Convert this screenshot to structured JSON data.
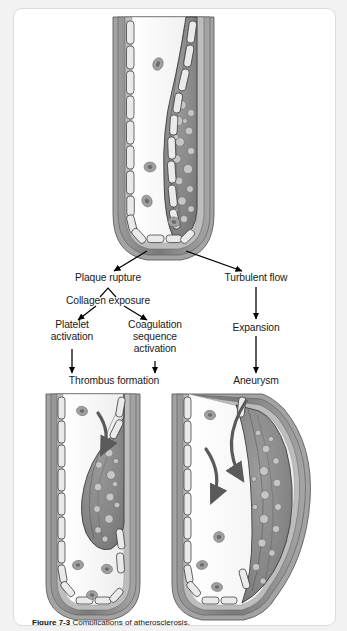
{
  "figure": {
    "caption_bold": "Figure 7-3",
    "caption_rest": "Complications of atherosclerosis.",
    "background_color": "#f2f2f2",
    "card_color": "#ffffff",
    "border_color": "#dcdcdc"
  },
  "flowchart": {
    "nodes": [
      {
        "id": "plaque-rupture",
        "label": "Plaque rupture",
        "x": 94,
        "y": 270,
        "branch": "left"
      },
      {
        "id": "collagen-exposure",
        "label": "Collagen exposure",
        "x": 94,
        "y": 292,
        "branch": "left"
      },
      {
        "id": "platelet-activation",
        "label": "Platelet\nactivation",
        "x": 58,
        "y": 315,
        "branch": "left"
      },
      {
        "id": "coagulation-sequence",
        "label": "Coagulation\nsequence\nactivation",
        "x": 141,
        "y": 315,
        "branch": "left"
      },
      {
        "id": "thrombus-formation",
        "label": "Thrombus formation",
        "x": 100,
        "y": 372,
        "branch": "left"
      },
      {
        "id": "turbulent-flow",
        "label": "Turbulent flow",
        "x": 242,
        "y": 270,
        "branch": "right"
      },
      {
        "id": "expansion",
        "label": "Expansion",
        "x": 242,
        "y": 319,
        "branch": "right"
      },
      {
        "id": "aneurysm",
        "label": "Aneurysm",
        "x": 242,
        "y": 372,
        "branch": "right"
      }
    ],
    "node_labels": {
      "plaque_rupture": "Plaque rupture",
      "collagen_exposure": "Collagen exposure",
      "platelet_activation_line1": "Platelet",
      "platelet_activation_line2": "activation",
      "coagulation_line1": "Coagulation",
      "coagulation_line2": "sequence",
      "coagulation_line3": "activation",
      "thrombus_formation": "Thrombus formation",
      "turbulent_flow": "Turbulent flow",
      "expansion": "Expansion",
      "aneurysm": "Aneurysm"
    }
  },
  "illustrations": [
    {
      "id": "top-vessel",
      "name": "artery-with-atherosclerotic-plaque",
      "position": "top-center",
      "elements": [
        "vessel-wall",
        "endothelium",
        "atherosclerotic-plaque",
        "foam-cells",
        "red-blood-cells",
        "lumen"
      ]
    },
    {
      "id": "bottom-left-vessel",
      "name": "artery-with-thrombus",
      "position": "bottom-left",
      "elements": [
        "vessel-wall",
        "endothelium",
        "thrombus",
        "flow-arrow",
        "red-blood-cells",
        "lumen"
      ]
    },
    {
      "id": "bottom-right-vessel",
      "name": "artery-with-aneurysm",
      "position": "bottom-right",
      "elements": [
        "vessel-wall",
        "endothelium",
        "aneurysmal-dilation",
        "turbulent-flow-arrows",
        "red-blood-cells",
        "lumen"
      ]
    }
  ],
  "colors": {
    "adventitia": "#8f8f8f",
    "media_dark": "#6f6f6f",
    "media_light": "#a8a8a8",
    "endothelial_cell": "#e8e8e8",
    "plaque_fill": "#8a8a8a",
    "plaque_stroke": "#3d3d3d",
    "foam_cell": "#c9c9c9",
    "lumen": "#f4f4f4",
    "rbc": "#9a9a9a",
    "rbc_core": "#6a6a6a",
    "arrow": "#000000",
    "flow_arrow": "#5a5a5a",
    "text": "#1a1a1a"
  }
}
